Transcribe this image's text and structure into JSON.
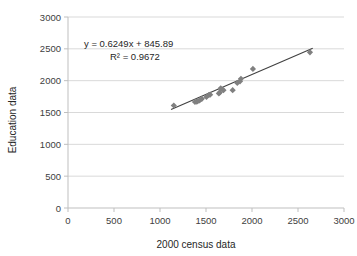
{
  "chart_data": {
    "type": "scatter",
    "title": "",
    "xlabel": "2000 census data",
    "ylabel": "Education data",
    "xlim": [
      0,
      3000
    ],
    "ylim": [
      0,
      3000
    ],
    "xticks": [
      0,
      500,
      1000,
      1500,
      2000,
      2500,
      3000
    ],
    "yticks": [
      0,
      500,
      1000,
      1500,
      2000,
      2500,
      3000
    ],
    "xtick_labels": [
      "0",
      "500",
      "1000",
      "1500",
      "2000",
      "2500",
      "3000"
    ],
    "ytick_labels": [
      "0",
      "500",
      "1000",
      "1500",
      "2000",
      "2500",
      "3000"
    ],
    "grid": "horizontal",
    "legend": "none",
    "marker": "diamond",
    "marker_color": "#808080",
    "trendline_color": "#404040",
    "gridline_color": "#d9d9d9",
    "axis_color": "#bfbfbf",
    "annotations": [
      "y = 0.6249x + 845.89",
      "R² = 0.9672"
    ],
    "equation": "y = 0.6249x + 845.89",
    "r_squared": "R² = 0.9672",
    "slope": 0.6249,
    "intercept": 845.89,
    "trendline_x": [
      1120,
      2660
    ],
    "points": [
      {
        "x": 1150,
        "y": 1610
      },
      {
        "x": 1380,
        "y": 1665
      },
      {
        "x": 1400,
        "y": 1670
      },
      {
        "x": 1410,
        "y": 1680
      },
      {
        "x": 1430,
        "y": 1690
      },
      {
        "x": 1455,
        "y": 1715
      },
      {
        "x": 1505,
        "y": 1745
      },
      {
        "x": 1530,
        "y": 1775
      },
      {
        "x": 1545,
        "y": 1780
      },
      {
        "x": 1640,
        "y": 1800
      },
      {
        "x": 1650,
        "y": 1815
      },
      {
        "x": 1660,
        "y": 1880
      },
      {
        "x": 1690,
        "y": 1850
      },
      {
        "x": 1790,
        "y": 1850
      },
      {
        "x": 1840,
        "y": 1965
      },
      {
        "x": 1870,
        "y": 1990
      },
      {
        "x": 1880,
        "y": 2030
      },
      {
        "x": 2010,
        "y": 2185
      },
      {
        "x": 2630,
        "y": 2445
      }
    ]
  }
}
